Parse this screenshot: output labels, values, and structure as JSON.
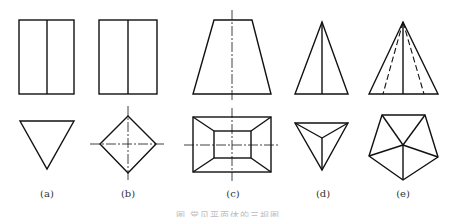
{
  "figure": {
    "labels": [
      "(a)",
      "(b)",
      "(c)",
      "(d)",
      "(e)"
    ],
    "caption": "图 常见平面体的三视图",
    "items": [
      {
        "id": "a",
        "name": "triangular prism",
        "views": [
          "front",
          "top"
        ]
      },
      {
        "id": "b",
        "name": "square prism (rotated)",
        "views": [
          "front",
          "top"
        ]
      },
      {
        "id": "c",
        "name": "frustum of rectangular pyramid",
        "views": [
          "front",
          "top"
        ]
      },
      {
        "id": "d",
        "name": "triangular pyramid",
        "views": [
          "front",
          "top"
        ]
      },
      {
        "id": "e",
        "name": "pentagonal pyramid",
        "views": [
          "front",
          "top"
        ]
      }
    ],
    "colors": {
      "line": "#111111",
      "background": "#ffffff"
    }
  }
}
